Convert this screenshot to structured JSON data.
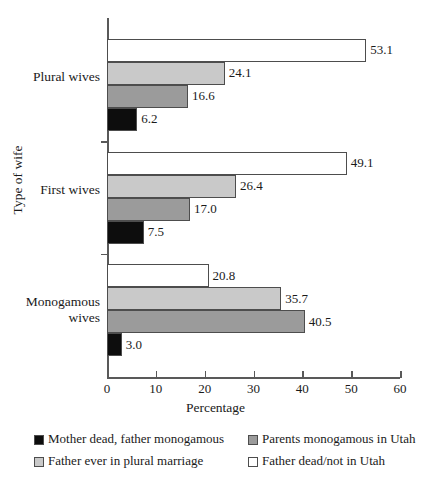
{
  "chart_data": {
    "type": "bar",
    "orientation": "horizontal",
    "title": "",
    "xlabel": "Percentage",
    "ylabel": "Type of wife",
    "xlim": [
      0,
      60
    ],
    "xticks": [
      0,
      10,
      20,
      30,
      40,
      50,
      60
    ],
    "xtick_labels": [
      "0",
      "10",
      "20",
      "30",
      "40",
      "50",
      "60"
    ],
    "grid": false,
    "legend_position": "bottom",
    "categories": [
      "Plural wives",
      "First wives",
      "Monogamous\nwives"
    ],
    "series": [
      {
        "name": "Father dead/not in Utah",
        "color": "#ffffff",
        "values": [
          53.1,
          49.1,
          20.8
        ],
        "labels": [
          "53.1",
          "49.1",
          "20.8"
        ]
      },
      {
        "name": "Father ever in plural marriage",
        "color": "#c9c9c9",
        "values": [
          24.1,
          26.4,
          35.7
        ],
        "labels": [
          "24.1",
          "26.4",
          "35.7"
        ]
      },
      {
        "name": "Parents monogamous in Utah",
        "color": "#9b9b9b",
        "values": [
          16.6,
          17.0,
          40.5
        ],
        "labels": [
          "16.6",
          "17.0",
          "40.5"
        ]
      },
      {
        "name": "Mother dead, father monogamous",
        "color": "#0d0d0d",
        "values": [
          6.2,
          7.5,
          3.0
        ],
        "labels": [
          "6.2",
          "7.5",
          "3.0"
        ]
      }
    ],
    "legend_entries": [
      {
        "label": "Mother dead, father monogamous",
        "color": "#0d0d0d"
      },
      {
        "label": "Parents monogamous in Utah",
        "color": "#9b9b9b"
      },
      {
        "label": "Father ever in plural marriage",
        "color": "#c9c9c9"
      },
      {
        "label": "Father dead/not in Utah",
        "color": "#ffffff"
      }
    ]
  }
}
